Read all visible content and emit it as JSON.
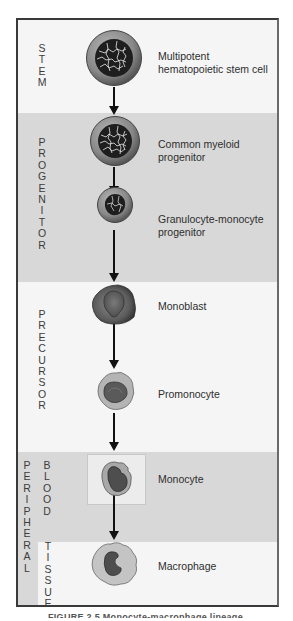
{
  "diagram": {
    "stages": [
      {
        "id": "stem",
        "label": "STEM",
        "letters": [
          "S",
          "T",
          "E",
          "M"
        ],
        "shade": "light"
      },
      {
        "id": "progenitor",
        "label": "PROGENITOR",
        "letters": [
          "P",
          "R",
          "O",
          "G",
          "E",
          "N",
          "I",
          "T",
          "O",
          "R"
        ],
        "shade": "gray"
      },
      {
        "id": "precursor",
        "label": "PRECURSOR",
        "letters": [
          "P",
          "R",
          "E",
          "C",
          "U",
          "R",
          "S",
          "O",
          "R"
        ],
        "shade": "light"
      },
      {
        "id": "peripheral",
        "label": "PERIPHERAL",
        "letters": [
          "P",
          "E",
          "R",
          "I",
          "P",
          "H",
          "E",
          "R",
          "A",
          "L"
        ],
        "shade": "gray"
      },
      {
        "id": "blood",
        "label": "BLOOD",
        "letters": [
          "B",
          "L",
          "O",
          "O",
          "D"
        ],
        "shade": "gray"
      },
      {
        "id": "tissue",
        "label": "TISSUE",
        "letters": [
          "T",
          "I",
          "S",
          "S",
          "U",
          "E"
        ],
        "shade": "light"
      }
    ],
    "cells": [
      {
        "id": "hsc",
        "line1": "Multipotent",
        "line2": "hematopoietic stem cell",
        "stage": "stem"
      },
      {
        "id": "cmp",
        "line1": "Common myeloid",
        "line2": "progenitor",
        "stage": "progenitor"
      },
      {
        "id": "gmp",
        "line1": "Granulocyte-monocyte",
        "line2": "progenitor",
        "stage": "progenitor"
      },
      {
        "id": "monoblast",
        "line1": "Monoblast",
        "line2": "",
        "stage": "precursor"
      },
      {
        "id": "promonocyte",
        "line1": "Promonocyte",
        "line2": "",
        "stage": "precursor"
      },
      {
        "id": "monocyte",
        "line1": "Monocyte",
        "line2": "",
        "stage": "peripheral blood"
      },
      {
        "id": "macrophage",
        "line1": "Macrophage",
        "line2": "",
        "stage": "tissue"
      }
    ],
    "colors": {
      "band_light": "#f5f5f5",
      "band_gray": "#d8d8d8",
      "frame": "#3a3a3a",
      "arrow": "#111111",
      "nucleus_dark": "#1e1e1e",
      "cytoplasm": "#8f8f8f"
    }
  },
  "caption": {
    "text": "FIGURE 2.5  Monocyte-macrophage lineage"
  }
}
